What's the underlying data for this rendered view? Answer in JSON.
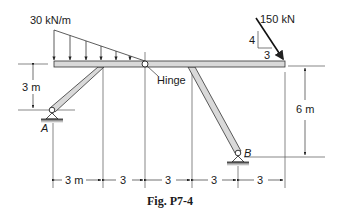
{
  "figure": {
    "caption": "Fig. P7-4",
    "load_distributed": "30 kN/m",
    "load_point": "150 kN",
    "slope_rise": "4",
    "slope_run": "3",
    "hinge_label": "Hinge",
    "support_a": "A",
    "support_b": "B",
    "height_left": "3 m",
    "height_right": "6 m",
    "spans": [
      "3 m",
      "3",
      "3",
      "3",
      "3"
    ]
  },
  "colors": {
    "member_fill": "#d9d9d9",
    "line": "#333333"
  }
}
